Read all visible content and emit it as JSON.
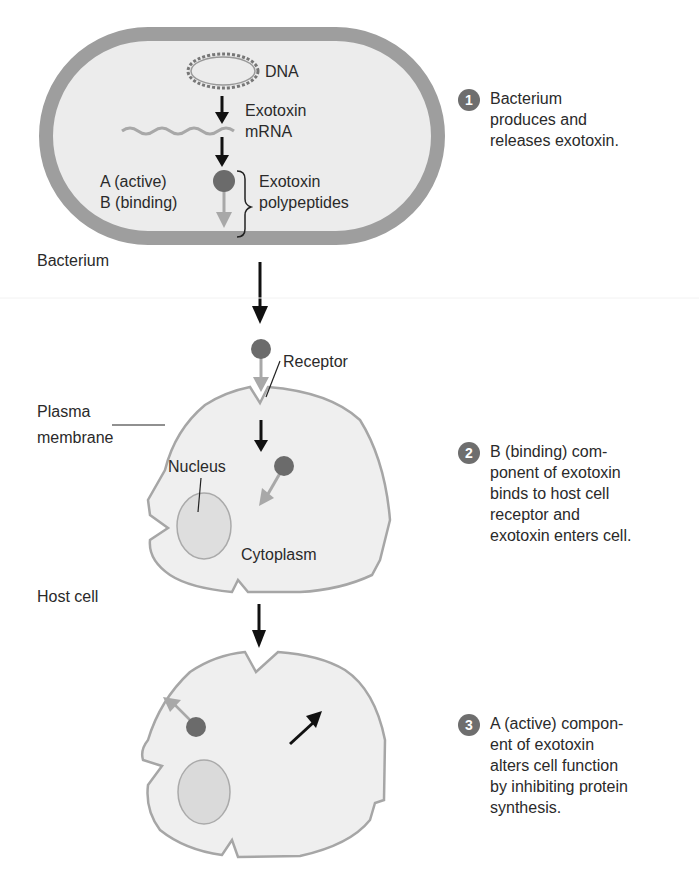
{
  "labels": {
    "dna": "DNA",
    "exotoxin_mrna_1": "Exotoxin",
    "exotoxin_mrna_2": "mRNA",
    "a_active": "A (active)",
    "b_binding": "B (binding)",
    "polypeptides_1": "Exotoxin",
    "polypeptides_2": "polypeptides",
    "bacterium": "Bacterium",
    "receptor": "Receptor",
    "plasma_1": "Plasma",
    "plasma_2": "membrane",
    "nucleus": "Nucleus",
    "cytoplasm": "Cytoplasm",
    "host_cell": "Host cell"
  },
  "steps": [
    {
      "number": "1",
      "text": "Bacterium\nproduces and\nreleases exotoxin."
    },
    {
      "number": "2",
      "text": "B (binding) com-\nponent of exotoxin\nbinds to host cell\nreceptor and\nexotoxin enters cell."
    },
    {
      "number": "3",
      "text": "A (active) compon-\nent of exotoxin\nalters cell function\nby inhibiting protein\nsynthesis."
    }
  ],
  "colors": {
    "cell_wall": "#9e9e9e",
    "cell_fill": "#efefef",
    "toxin_a": "#6b6b6b",
    "toxin_b": "#a8a8a8",
    "badge": "#6e6e6e"
  }
}
